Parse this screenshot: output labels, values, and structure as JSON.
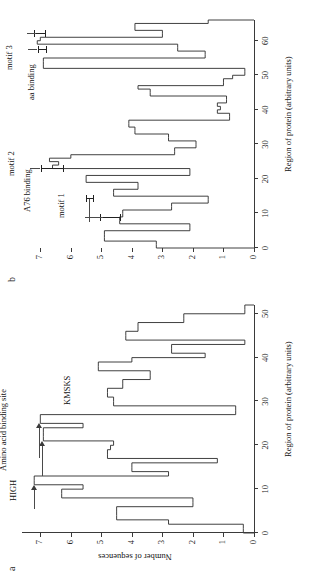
{
  "figure": {
    "background": "#ffffff",
    "ink": "#2b2b2b",
    "rotation_note": "page printed sideways",
    "shared_xlabel": "Region of protein (arbitrary units)"
  },
  "panel_a": {
    "letter": "a",
    "ylabel": "Number of sequences",
    "xlabel": "Region of protein (arbitrary units)",
    "xticks": [
      "0",
      "10",
      "20",
      "30",
      "40",
      "50"
    ],
    "yticks": [
      "0",
      "1",
      "2",
      "3",
      "4",
      "5",
      "6",
      "7"
    ],
    "annotations": [
      {
        "label": "HIGH",
        "kind": "text"
      },
      {
        "label": "Amino acid binding site",
        "kind": "text-with-arrows"
      },
      {
        "label": "KMSKS",
        "kind": "text"
      }
    ]
  },
  "panel_b": {
    "letter": "b",
    "xlabel": "Region of protein (arbitrary units)",
    "xticks": [
      "0",
      "10",
      "20",
      "30",
      "40",
      "50",
      "60"
    ],
    "yticks": [
      "0",
      "1",
      "2",
      "3",
      "4",
      "5",
      "6",
      "7"
    ],
    "annotations": [
      {
        "label": "motif 1",
        "kind": "ibeam"
      },
      {
        "label": "A76 binding",
        "kind": "leader-ibeam"
      },
      {
        "label": "motif 2",
        "kind": "ibeam"
      },
      {
        "label": "aa binding",
        "kind": "ibeam"
      },
      {
        "label": "motif 3",
        "kind": "ibeam"
      }
    ]
  },
  "chart_data": [
    {
      "id": "panel_a",
      "type": "bar",
      "title": "a",
      "xlabel": "Region of protein (arbitrary units)",
      "ylabel": "Number of sequences",
      "xlim": [
        0,
        52
      ],
      "ylim": [
        0,
        7.6
      ],
      "xticks": [
        0,
        10,
        20,
        30,
        40,
        50
      ],
      "yticks": [
        0,
        1,
        2,
        3,
        4,
        5,
        6,
        7
      ],
      "grid": false,
      "legend": null,
      "x": [
        0,
        1,
        2,
        3,
        4,
        5,
        6,
        7,
        8,
        9,
        10,
        11,
        12,
        13,
        14,
        15,
        16,
        17,
        18,
        19,
        20,
        21,
        22,
        23,
        24,
        25,
        26,
        27,
        28,
        29,
        30,
        31,
        32,
        33,
        34,
        35,
        36,
        37,
        38,
        39,
        40,
        41,
        42,
        43,
        44,
        45,
        46,
        47,
        48,
        49,
        50,
        51
      ],
      "values": [
        0.35,
        0.35,
        2.8,
        4.5,
        4.5,
        4.5,
        2.0,
        2.0,
        6.3,
        6.3,
        5.6,
        7.2,
        7.2,
        2.8,
        4.0,
        4.0,
        1.2,
        4.8,
        4.8,
        4.7,
        4.6,
        6.9,
        6.9,
        6.9,
        5.6,
        7.0,
        7.0,
        0.6,
        0.6,
        4.6,
        4.6,
        4.8,
        4.8,
        4.3,
        4.3,
        3.4,
        3.4,
        5.1,
        5.1,
        4.0,
        1.6,
        2.7,
        2.7,
        0.3,
        4.2,
        4.2,
        3.8,
        3.8,
        2.3,
        2.3,
        0.3,
        0.3
      ],
      "annotations": [
        {
          "text": "HIGH",
          "x": 10,
          "y": 7.2
        },
        {
          "text": "Amino acid binding site",
          "x": 22,
          "y": 7.3
        },
        {
          "text": "KMSKS",
          "x": 29,
          "y": 5.5
        }
      ]
    },
    {
      "id": "panel_b",
      "type": "bar",
      "title": "b",
      "xlabel": "Region of protein (arbitrary units)",
      "ylabel": "",
      "xlim": [
        0,
        66
      ],
      "ylim": [
        0,
        7.6
      ],
      "xticks": [
        0,
        10,
        20,
        30,
        40,
        50,
        60
      ],
      "yticks": [
        0,
        1,
        2,
        3,
        4,
        5,
        6,
        7
      ],
      "grid": false,
      "legend": null,
      "x": [
        0,
        1,
        2,
        3,
        4,
        5,
        6,
        7,
        8,
        9,
        10,
        11,
        12,
        13,
        14,
        15,
        16,
        17,
        18,
        19,
        20,
        21,
        22,
        23,
        24,
        25,
        26,
        27,
        28,
        29,
        30,
        31,
        32,
        33,
        34,
        35,
        36,
        37,
        38,
        39,
        40,
        41,
        42,
        43,
        44,
        45,
        46,
        47,
        48,
        49,
        50,
        51,
        52,
        53,
        54,
        55,
        56,
        57,
        58,
        59,
        60,
        61,
        62,
        63,
        64,
        65
      ],
      "values": [
        3.2,
        3.2,
        4.9,
        4.9,
        4.9,
        2.1,
        2.1,
        4.4,
        4.4,
        4.3,
        4.3,
        2.7,
        2.7,
        1.5,
        1.5,
        4.6,
        4.6,
        3.8,
        3.8,
        5.5,
        5.5,
        2.1,
        2.1,
        6.6,
        6.4,
        6.7,
        6.0,
        2.6,
        2.6,
        1.9,
        1.9,
        2.8,
        2.8,
        3.9,
        3.9,
        4.1,
        4.1,
        0.8,
        0.8,
        1.2,
        1.1,
        1.2,
        0.9,
        0.9,
        3.4,
        3.4,
        3.8,
        1.0,
        1.0,
        0.7,
        0.3,
        0.3,
        6.9,
        6.9,
        6.9,
        1.6,
        1.6,
        2.5,
        2.5,
        7.1,
        7.0,
        3.0,
        3.0,
        3.9,
        3.9,
        1.5
      ],
      "annotations": [
        {
          "text": "motif 1",
          "x": 9,
          "y": 4.7
        },
        {
          "text": "A76 binding",
          "x": 14,
          "y": 5.4
        },
        {
          "text": "motif 2",
          "x": 24,
          "y": 6.9
        },
        {
          "text": "aa binding",
          "x": 57,
          "y": 6.9
        },
        {
          "text": "motif 3",
          "x": 62,
          "y": 7.0
        }
      ]
    }
  ]
}
